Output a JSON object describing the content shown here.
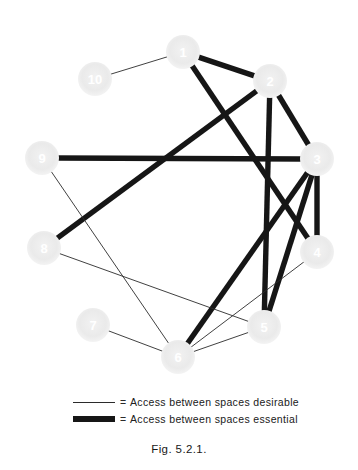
{
  "figure": {
    "caption": "Fig. 5.2.1."
  },
  "legend": {
    "equals_symbol": "=",
    "rows": [
      {
        "style": "thin",
        "icon": "thin-line-icon",
        "label": "Access between spaces desirable"
      },
      {
        "style": "thick",
        "icon": "thick-line-icon",
        "label": "Access between spaces essential"
      }
    ]
  },
  "colors": {
    "node_fill": "#ededed",
    "node_label": "#ffffff",
    "edge_thin": "#2b2b2b",
    "edge_thick": "#161616",
    "background": "#ffffff"
  },
  "graph": {
    "type": "adjacency-bubble-diagram",
    "node_radius": 17,
    "nodes": [
      {
        "id": "1",
        "label": "1",
        "x": 183,
        "y": 52
      },
      {
        "id": "2",
        "label": "2",
        "x": 270,
        "y": 81
      },
      {
        "id": "3",
        "label": "3",
        "x": 317,
        "y": 159
      },
      {
        "id": "4",
        "label": "4",
        "x": 317,
        "y": 252
      },
      {
        "id": "5",
        "label": "5",
        "x": 264,
        "y": 327
      },
      {
        "id": "6",
        "label": "6",
        "x": 178,
        "y": 357
      },
      {
        "id": "7",
        "label": "7",
        "x": 93,
        "y": 325
      },
      {
        "id": "8",
        "label": "8",
        "x": 44,
        "y": 248
      },
      {
        "id": "9",
        "label": "9",
        "x": 42,
        "y": 158
      },
      {
        "id": "10",
        "label": "10",
        "x": 95,
        "y": 79
      }
    ],
    "edges": [
      {
        "from": "10",
        "to": "1",
        "style": "thin"
      },
      {
        "from": "1",
        "to": "2",
        "style": "thick"
      },
      {
        "from": "1",
        "to": "4",
        "style": "thick"
      },
      {
        "from": "2",
        "to": "3",
        "style": "thick"
      },
      {
        "from": "2",
        "to": "5",
        "style": "thick"
      },
      {
        "from": "2",
        "to": "8",
        "style": "thick"
      },
      {
        "from": "3",
        "to": "4",
        "style": "thick"
      },
      {
        "from": "3",
        "to": "5",
        "style": "thick"
      },
      {
        "from": "3",
        "to": "6",
        "style": "thick"
      },
      {
        "from": "3",
        "to": "9",
        "style": "thick"
      },
      {
        "from": "4",
        "to": "6",
        "style": "thin"
      },
      {
        "from": "5",
        "to": "6",
        "style": "thin"
      },
      {
        "from": "5",
        "to": "8",
        "style": "thin"
      },
      {
        "from": "6",
        "to": "7",
        "style": "thin"
      },
      {
        "from": "6",
        "to": "9",
        "style": "thin"
      }
    ]
  }
}
